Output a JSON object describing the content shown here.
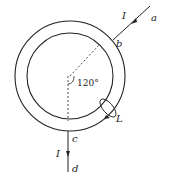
{
  "diagram": {
    "type": "physics-circuit-ring",
    "labels": {
      "current_top": "I",
      "point_a": "a",
      "point_b": "b",
      "point_c": "c",
      "point_d": "d",
      "current_bottom": "I",
      "loop": "L",
      "angle": "120°"
    },
    "colors": {
      "stroke": "#222222",
      "background": "#ffffff"
    }
  }
}
